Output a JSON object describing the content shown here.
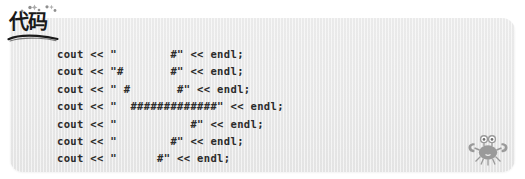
{
  "panel": {
    "label": "code-listing-panel",
    "background_color": "#eaeaea",
    "border_radius": "13px"
  },
  "badge": {
    "text": "代码",
    "translation_note": "code",
    "text_color": "#1a1a1a",
    "sparkle_icon_name": "sparkle-icon",
    "underline_icon_name": "hand-drawn-underline"
  },
  "code": {
    "language": "C++",
    "lines": [
      "cout << \"        #\" << endl;",
      "cout << \"#       #\" << endl;",
      "cout << \" #       #\" << endl;",
      "cout << \"  #############\" << endl;",
      "cout << \"           #\" << endl;",
      "cout << \"        #\" << endl;",
      "cout << \"      #\" << endl;"
    ],
    "line_count": 7,
    "text_color": "#2b2b2b"
  },
  "decoration": {
    "crab_icon_name": "crab-icon",
    "crab_color": "#9a9a9a"
  }
}
